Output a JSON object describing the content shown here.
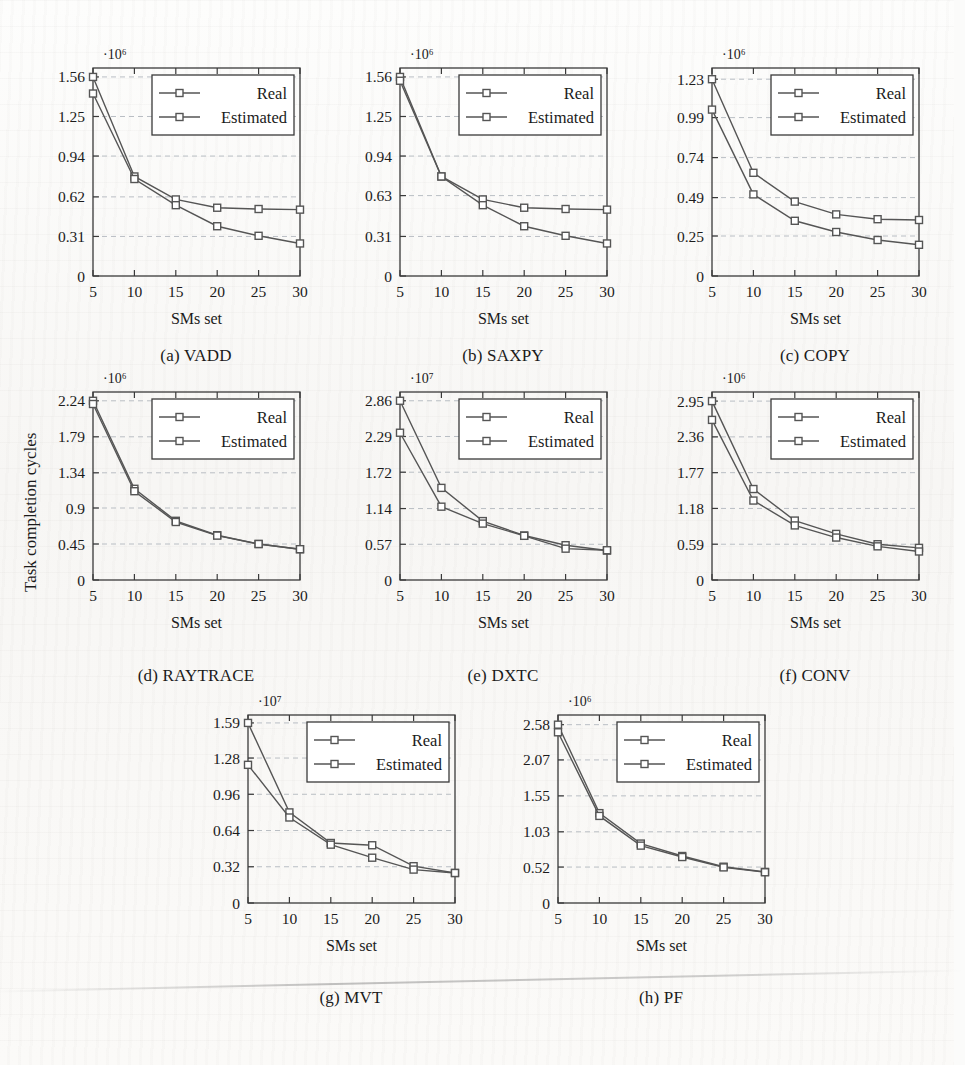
{
  "figure": {
    "y_axis_label": "Task completion cycles",
    "x_axis_label": "SMs set",
    "series_names": [
      "Real",
      "Estimated"
    ],
    "line_color": "#555555",
    "marker_color": "#555555",
    "grid_color": "#b9bec4",
    "axis_color": "#3a3a3a",
    "legend_bg": "#ffffff"
  },
  "chart_data": [
    {
      "type": "line",
      "panel": "a",
      "caption": "(a)  VADD",
      "title": "",
      "xlabel": "SMs set",
      "ylabel": "",
      "exponent": "·10⁶",
      "x": [
        5,
        10,
        15,
        20,
        25,
        30
      ],
      "xticklabels": [
        "5",
        "10",
        "15",
        "20",
        "25",
        "30"
      ],
      "yticklabels": [
        "0",
        "0.31",
        "0.62",
        "0.94",
        "1.25",
        "1.56"
      ],
      "ytickvalues": [
        0,
        0.31,
        0.62,
        0.94,
        1.25,
        1.56
      ],
      "ylim": [
        0,
        1.63
      ],
      "grid": true,
      "legend": "upper-right-inset",
      "series": [
        {
          "name": "Real",
          "values": [
            1.56,
            0.78,
            0.6,
            0.535,
            0.525,
            0.52
          ]
        },
        {
          "name": "Estimated",
          "values": [
            1.43,
            0.76,
            0.555,
            0.39,
            0.315,
            0.255
          ]
        }
      ]
    },
    {
      "type": "line",
      "panel": "b",
      "caption": "(b)  SAXPY",
      "title": "",
      "xlabel": "SMs set",
      "ylabel": "",
      "exponent": "·10⁶",
      "x": [
        5,
        10,
        15,
        20,
        25,
        30
      ],
      "xticklabels": [
        "5",
        "10",
        "15",
        "20",
        "25",
        "30"
      ],
      "yticklabels": [
        "0",
        "0.31",
        "0.63",
        "0.94",
        "1.25",
        "1.56"
      ],
      "ytickvalues": [
        0,
        0.31,
        0.63,
        0.94,
        1.25,
        1.56
      ],
      "ylim": [
        0,
        1.63
      ],
      "grid": true,
      "legend": "upper-right-inset",
      "series": [
        {
          "name": "Real",
          "values": [
            1.56,
            0.78,
            0.6,
            0.535,
            0.525,
            0.52
          ]
        },
        {
          "name": "Estimated",
          "values": [
            1.53,
            0.78,
            0.555,
            0.39,
            0.315,
            0.255
          ]
        }
      ]
    },
    {
      "type": "line",
      "panel": "c",
      "caption": "(c)  COPY",
      "title": "",
      "xlabel": "SMs set",
      "ylabel": "",
      "exponent": "·10⁶",
      "x": [
        5,
        10,
        15,
        20,
        25,
        30
      ],
      "xticklabels": [
        "5",
        "10",
        "15",
        "20",
        "25",
        "30"
      ],
      "yticklabels": [
        "0",
        "0.25",
        "0.49",
        "0.74",
        "0.99",
        "1.23"
      ],
      "ytickvalues": [
        0,
        0.25,
        0.49,
        0.74,
        0.99,
        1.23
      ],
      "ylim": [
        0,
        1.3
      ],
      "grid": true,
      "legend": "upper-right-inset",
      "series": [
        {
          "name": "Real",
          "values": [
            1.23,
            0.645,
            0.465,
            0.385,
            0.355,
            0.35
          ]
        },
        {
          "name": "Estimated",
          "values": [
            1.04,
            0.51,
            0.345,
            0.275,
            0.225,
            0.195
          ]
        }
      ]
    },
    {
      "type": "line",
      "panel": "d",
      "caption": "(d)  RAYTRACE",
      "title": "",
      "xlabel": "SMs set",
      "ylabel": "Task completion cycles",
      "exponent": "·10⁶",
      "x": [
        5,
        10,
        15,
        20,
        25,
        30
      ],
      "xticklabels": [
        "5",
        "10",
        "15",
        "20",
        "25",
        "30"
      ],
      "yticklabels": [
        "0",
        "0.45",
        "0.9",
        "1.34",
        "1.79",
        "2.24"
      ],
      "ytickvalues": [
        0,
        0.45,
        0.9,
        1.34,
        1.79,
        2.24
      ],
      "ylim": [
        0,
        2.35
      ],
      "grid": true,
      "legend": "upper-right-inset",
      "series": [
        {
          "name": "Real",
          "values": [
            2.24,
            1.14,
            0.74,
            0.56,
            0.45,
            0.385
          ]
        },
        {
          "name": "Estimated",
          "values": [
            2.2,
            1.11,
            0.725,
            0.555,
            0.45,
            0.385
          ]
        }
      ]
    },
    {
      "type": "line",
      "panel": "e",
      "caption": "(e)  DXTC",
      "title": "",
      "xlabel": "SMs set",
      "ylabel": "",
      "exponent": "·10⁷",
      "x": [
        5,
        10,
        15,
        20,
        25,
        30
      ],
      "xticklabels": [
        "5",
        "10",
        "15",
        "20",
        "25",
        "30"
      ],
      "yticklabels": [
        "0",
        "0.57",
        "1.14",
        "1.72",
        "2.29",
        "2.86"
      ],
      "ytickvalues": [
        0,
        0.57,
        1.14,
        1.72,
        2.29,
        2.86
      ],
      "ylim": [
        0,
        3.0
      ],
      "grid": true,
      "legend": "upper-right-inset",
      "series": [
        {
          "name": "Real",
          "values": [
            2.86,
            1.47,
            0.94,
            0.71,
            0.555,
            0.47
          ]
        },
        {
          "name": "Estimated",
          "values": [
            2.35,
            1.17,
            0.9,
            0.705,
            0.5,
            0.475
          ]
        }
      ]
    },
    {
      "type": "line",
      "panel": "f",
      "caption": "(f)  CONV",
      "title": "",
      "xlabel": "SMs set",
      "ylabel": "",
      "exponent": "·10⁶",
      "x": [
        5,
        10,
        15,
        20,
        25,
        30
      ],
      "xticklabels": [
        "5",
        "10",
        "15",
        "20",
        "25",
        "30"
      ],
      "yticklabels": [
        "0",
        "0.59",
        "1.18",
        "1.77",
        "2.36",
        "2.95"
      ],
      "ytickvalues": [
        0,
        0.59,
        1.18,
        1.77,
        2.36,
        2.95
      ],
      "ylim": [
        0,
        3.1
      ],
      "grid": true,
      "legend": "upper-right-inset",
      "series": [
        {
          "name": "Real",
          "values": [
            2.95,
            1.5,
            0.98,
            0.76,
            0.59,
            0.53
          ]
        },
        {
          "name": "Estimated",
          "values": [
            2.64,
            1.31,
            0.9,
            0.7,
            0.555,
            0.47
          ]
        }
      ]
    },
    {
      "type": "line",
      "panel": "g",
      "caption": "(g)  MVT",
      "title": "",
      "xlabel": "SMs set",
      "ylabel": "",
      "exponent": "·10⁷",
      "x": [
        5,
        10,
        15,
        20,
        25,
        30
      ],
      "xticklabels": [
        "5",
        "10",
        "15",
        "20",
        "25",
        "30"
      ],
      "yticklabels": [
        "0",
        "0.32",
        "0.64",
        "0.96",
        "1.28",
        "1.59"
      ],
      "ytickvalues": [
        0,
        0.32,
        0.64,
        0.96,
        1.28,
        1.59
      ],
      "ylim": [
        0,
        1.66
      ],
      "grid": true,
      "legend": "upper-right-inset",
      "series": [
        {
          "name": "Real",
          "values": [
            1.59,
            0.8,
            0.53,
            0.51,
            0.325,
            0.265
          ]
        },
        {
          "name": "Estimated",
          "values": [
            1.22,
            0.755,
            0.515,
            0.4,
            0.295,
            0.265
          ]
        }
      ]
    },
    {
      "type": "line",
      "panel": "h",
      "caption": "(h)  PF",
      "title": "",
      "xlabel": "SMs set",
      "ylabel": "",
      "exponent": "·10⁶",
      "x": [
        5,
        10,
        15,
        20,
        25,
        30
      ],
      "xticklabels": [
        "5",
        "10",
        "15",
        "20",
        "25",
        "30"
      ],
      "yticklabels": [
        "0",
        "0.52",
        "1.03",
        "1.55",
        "2.07",
        "2.58"
      ],
      "ytickvalues": [
        0,
        0.52,
        1.03,
        1.55,
        2.07,
        2.58
      ],
      "ylim": [
        0,
        2.72
      ],
      "grid": true,
      "legend": "upper-right-inset",
      "series": [
        {
          "name": "Real",
          "values": [
            2.58,
            1.3,
            0.86,
            0.68,
            0.525,
            0.45
          ]
        },
        {
          "name": "Estimated",
          "values": [
            2.47,
            1.26,
            0.83,
            0.665,
            0.515,
            0.445
          ]
        }
      ]
    }
  ]
}
